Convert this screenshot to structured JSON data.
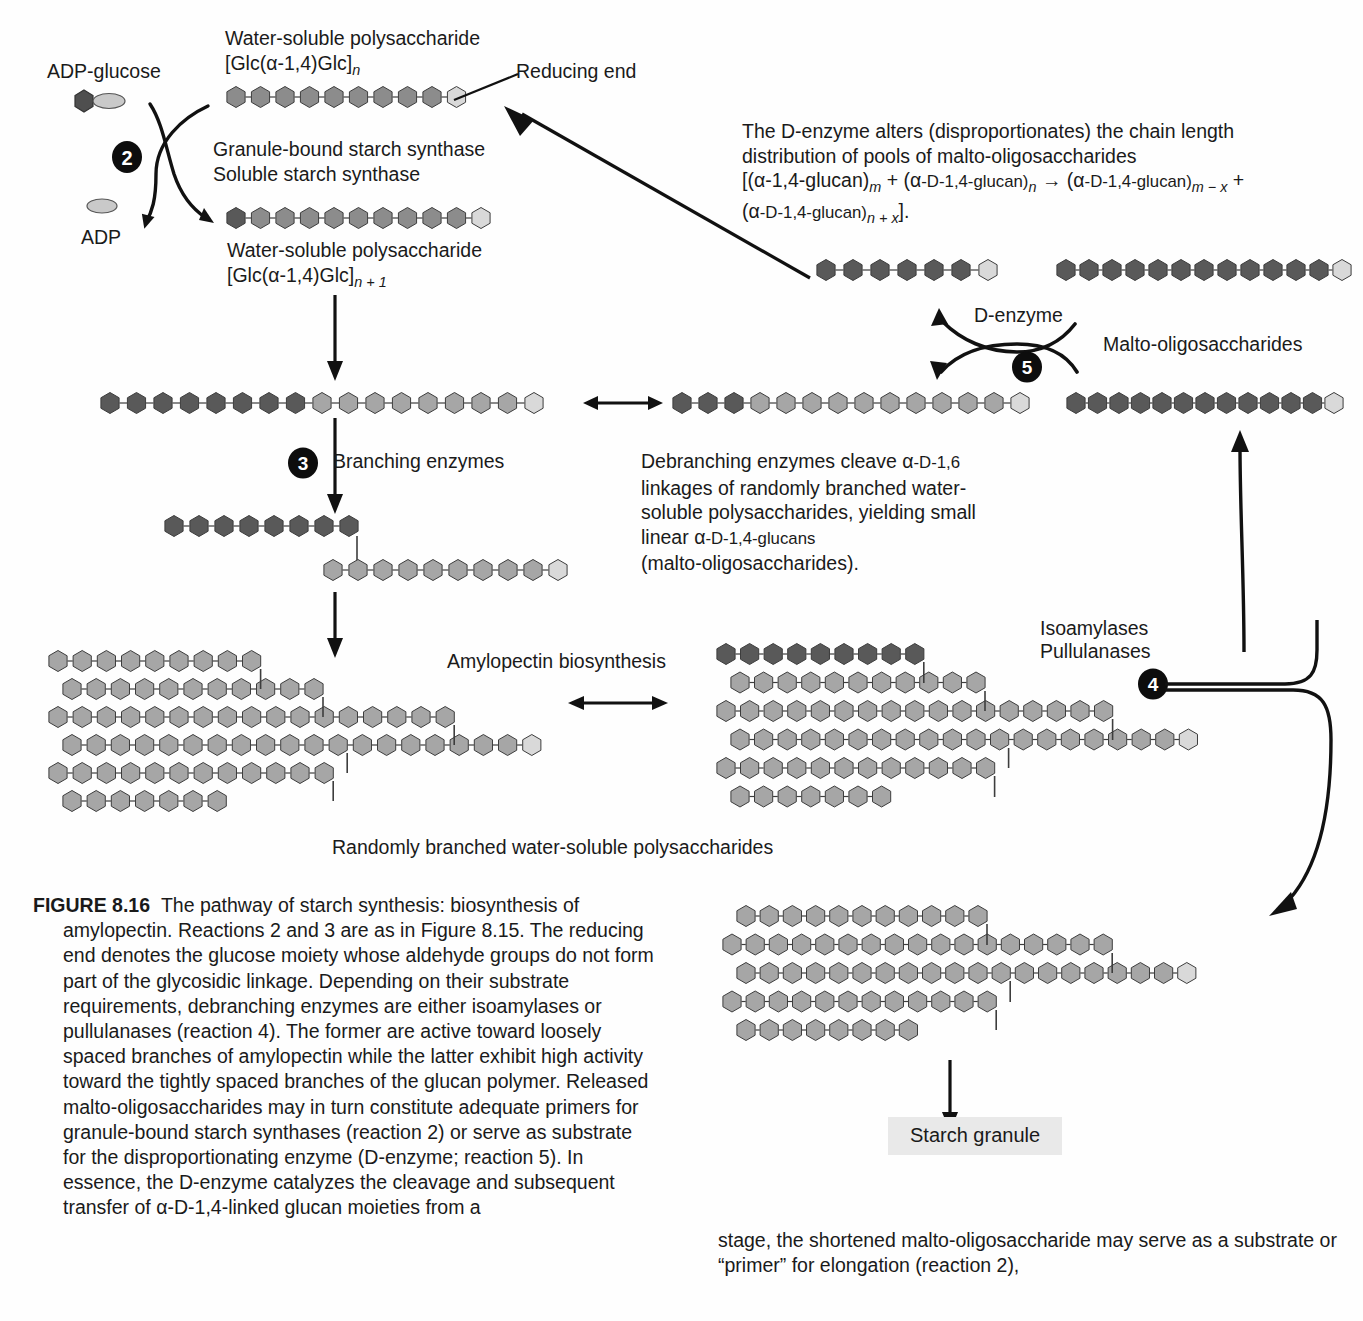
{
  "figure": {
    "number": "FIGURE 8.16",
    "caption_left": "The pathway of starch synthesis: biosynthesis of amylopectin. Reactions 2 and 3 are as in Figure 8.15. The reducing end denotes the glucose moiety whose aldehyde groups do not form part of the glycosidic linkage. Depending on their substrate requirements, debranching enzymes are either isoamylases or pullulanases (reaction 4). The former are active toward loosely spaced branches of amylopectin while the latter exhibit high activity toward the tightly spaced branches of the glucan polymer. Released malto-oligosaccharides may in turn constitute adequate primers for granule-bound starch synthases (reaction 2) or serve as substrate for the disproportionating enzyme (D-enzyme; reaction 5). In essence, the D-enzyme catalyzes the cleavage and subsequent transfer of α-D-1,4-linked glucan moieties from a",
    "caption_right": "stage, the shortened malto-oligosaccharide may serve as a substrate or “primer” for elongation (reaction 2),"
  },
  "labels": {
    "adp_glucose": "ADP-glucose",
    "adp": "ADP",
    "reducing_end": "Reducing end",
    "polysaccharide_n_line1": "Water-soluble polysaccharide",
    "polysaccharide_n_line2_pre": "[Glc(",
    "polysaccharide_n_line2_alpha": "α",
    "polysaccharide_n_line2_mid": "-1,4)Glc]",
    "polysaccharide_n_sub": "n",
    "polysaccharide_n1_line1": "Water-soluble polysaccharide",
    "polysaccharide_n1_sub": "n + 1",
    "enzyme_gbss": "Granule-bound starch synthase",
    "enzyme_sss": "Soluble starch synthase",
    "branching_enzymes": "Branching enzymes",
    "amylopectin_biosynthesis": "Amylopectin biosynthesis",
    "randomly_branched": "Randomly branched water-soluble polysaccharides",
    "isoamylases": "Isoamylases",
    "pullulanases": "Pullulanases",
    "d_enzyme": "D-enzyme",
    "malto_oligosaccharides": "Malto-oligosaccharides",
    "starch_granule": "Starch granule"
  },
  "reaction_numbers": {
    "two": "2",
    "three": "3",
    "four": "4",
    "five": "5"
  },
  "text_blocks": {
    "d_enzyme_note": {
      "line1": "The D-enzyme alters (disproportionates) the chain length",
      "line2": "distribution of pools of malto-oligosaccharides",
      "line3_a": "[(",
      "line3_alpha": "α",
      "line3_b": "-1,4-glucan)",
      "line3_sub1": "m",
      "line3_c": " + (",
      "line3_d": "-D-1,4-glucan)",
      "line3_sub2": "n",
      "line3_arrow": " → (",
      "line3_e": "-D-1,4-glucan)",
      "line3_sub3": "m − x",
      "line3_plus": " +",
      "line4_a": "(",
      "line4_b": "-D-1,4-glucan)",
      "line4_sub": "n + x",
      "line4_end": "]."
    },
    "debranching_note": {
      "line1_a": "Debranching enzymes cleave ",
      "line1_alpha": "α",
      "line1_b": "-D-1,6",
      "line2": "linkages of randomly branched water-",
      "line3": "soluble polysaccharides, yielding small",
      "line4_a": "linear ",
      "line4_b": "-D-1,4-glucans",
      "line5": "(malto-oligosaccharides)."
    }
  },
  "colors": {
    "hex_dark": "#595959",
    "hex_mid": "#8c8c8c",
    "hex_light": "#a6a6a6",
    "hex_pale": "#d9d9d9",
    "hex_stroke": "#3d3d3d",
    "line": "#1a1a1a",
    "granule_bg": "#e9e9e9"
  },
  "chains": {
    "polysaccharide_n": {
      "count": 10,
      "shades": [
        "mid",
        "mid",
        "mid",
        "mid",
        "mid",
        "mid",
        "mid",
        "mid",
        "mid",
        "pale"
      ]
    },
    "polysaccharide_n1": {
      "count": 11,
      "shades": [
        "dark",
        "mid",
        "mid",
        "mid",
        "mid",
        "mid",
        "mid",
        "mid",
        "mid",
        "mid",
        "pale"
      ]
    },
    "elongated": {
      "count": 17,
      "shades": [
        "dark",
        "dark",
        "dark",
        "dark",
        "dark",
        "dark",
        "dark",
        "dark",
        "light",
        "light",
        "light",
        "light",
        "light",
        "light",
        "light",
        "light",
        "pale"
      ]
    },
    "elongated_right": {
      "count": 14,
      "shades": [
        "dark",
        "dark",
        "dark",
        "light",
        "light",
        "light",
        "light",
        "light",
        "light",
        "light",
        "light",
        "light",
        "light",
        "pale"
      ]
    },
    "malto_short": {
      "count": 7,
      "shades": [
        "dark",
        "dark",
        "dark",
        "dark",
        "dark",
        "dark",
        "pale"
      ]
    },
    "malto_long": {
      "count": 13,
      "shades": [
        "dark",
        "dark",
        "dark",
        "dark",
        "dark",
        "dark",
        "dark",
        "dark",
        "dark",
        "dark",
        "dark",
        "dark",
        "pale"
      ]
    },
    "malto_short_bottom": {
      "count": 5,
      "shades": [
        "mid",
        "mid",
        "mid",
        "mid",
        "pale"
      ]
    },
    "malto_long_bottom": {
      "count": 10,
      "shades": [
        "mid",
        "mid",
        "mid",
        "mid",
        "mid",
        "mid",
        "mid",
        "mid",
        "mid",
        "pale"
      ]
    }
  }
}
